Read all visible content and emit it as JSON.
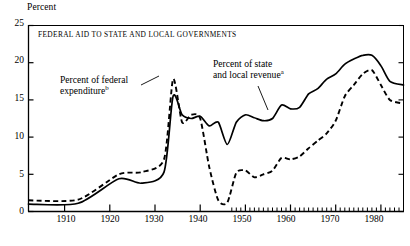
{
  "chart_data": {
    "type": "line",
    "title": "FEDERAL AID TO STATE AND LOCAL GOVERNMENTS",
    "xlabel": "",
    "ylabel": "Percent",
    "ylim": [
      0,
      25
    ],
    "xlim": [
      1902,
      1985
    ],
    "grid": false,
    "legend_position": "inline-annotations",
    "ytick_labels": [
      "25",
      "20",
      "15",
      "10",
      "5",
      "0"
    ],
    "ytick_values": [
      25,
      20,
      15,
      10,
      5,
      0
    ],
    "xtick_labels": [
      "1910",
      "1920",
      "1930",
      "1940",
      "1950",
      "1960",
      "1970",
      "1980"
    ],
    "xtick_values": [
      1910,
      1920,
      1930,
      1940,
      1950,
      1960,
      1970,
      1980
    ],
    "minor_xticks_note": "annual minor ticks drawn from 1947 to 1985 only",
    "annotations": [
      {
        "id": "federal",
        "text": "Percent of federal",
        "text2": "expenditure",
        "superscript": "b",
        "target_series": "Percent of federal expenditure"
      },
      {
        "id": "state",
        "text": "Percent of state",
        "text2": "and local revenue",
        "superscript": "a",
        "target_series": "Percent of state and local revenue"
      }
    ],
    "series": [
      {
        "name": "Percent of state and local revenue",
        "style": "solid",
        "color": "#000000",
        "x": [
          1902,
          1913,
          1922,
          1927,
          1932,
          1934,
          1936,
          1938,
          1940,
          1942,
          1944,
          1946,
          1948,
          1950,
          1952,
          1954,
          1956,
          1958,
          1960,
          1962,
          1964,
          1966,
          1968,
          1970,
          1972,
          1974,
          1976,
          1978,
          1980,
          1982,
          1985
        ],
        "values": [
          1.0,
          1.1,
          4.4,
          3.8,
          5.3,
          15.5,
          13.0,
          12.5,
          12.8,
          11.5,
          12.0,
          9.0,
          12.0,
          13.0,
          12.6,
          12.2,
          12.5,
          14.3,
          13.8,
          14.0,
          15.8,
          16.5,
          17.8,
          18.5,
          19.8,
          20.5,
          21.0,
          21.0,
          19.6,
          17.5,
          17.0
        ]
      },
      {
        "name": "Percent of federal expenditure",
        "style": "dashed",
        "color": "#000000",
        "x": [
          1902,
          1913,
          1922,
          1927,
          1932,
          1934,
          1936,
          1938,
          1940,
          1942,
          1944,
          1946,
          1948,
          1950,
          1952,
          1954,
          1956,
          1958,
          1960,
          1962,
          1964,
          1966,
          1968,
          1970,
          1972,
          1974,
          1976,
          1978,
          1980,
          1982,
          1985
        ],
        "values": [
          1.5,
          1.6,
          5.0,
          5.3,
          7.0,
          17.8,
          12.0,
          13.0,
          12.5,
          6.0,
          1.5,
          1.2,
          5.2,
          5.5,
          4.6,
          5.0,
          5.5,
          7.2,
          7.0,
          7.4,
          8.5,
          9.5,
          10.5,
          12.2,
          15.5,
          17.0,
          18.5,
          19.0,
          17.0,
          15.0,
          14.5
        ]
      }
    ]
  }
}
